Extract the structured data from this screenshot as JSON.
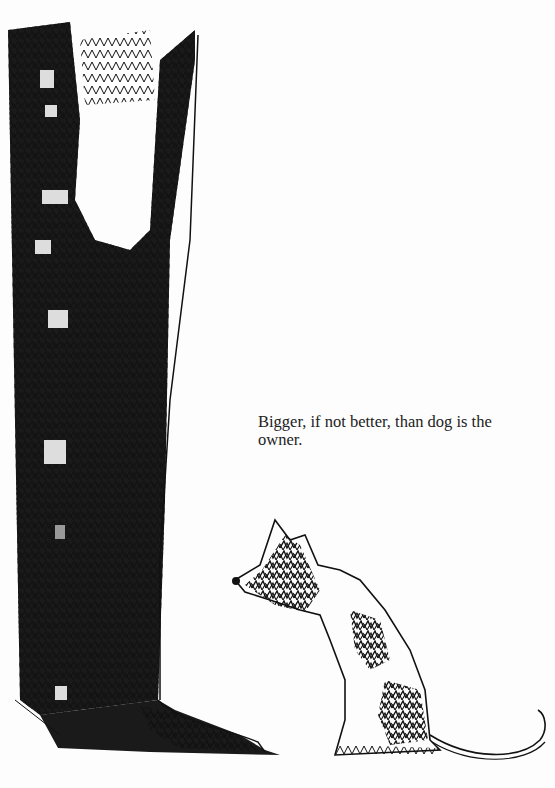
{
  "page": {
    "caption": "Bigger, if not better, than dog is the owner.",
    "illustration": {
      "subject": "Tall owner's leg and boot (heavily scribble-shaded) beside a small seated dog looking left",
      "ink_color": "#111111",
      "paper_color": "#fdfdfd"
    }
  }
}
